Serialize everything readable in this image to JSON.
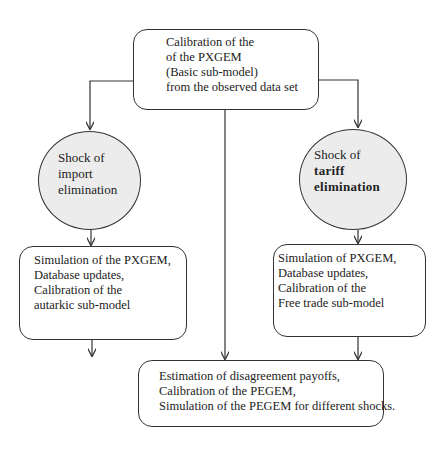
{
  "diagram": {
    "type": "flowchart",
    "top_box": {
      "lines": [
        "Calibration of the",
        "of the PXGEM",
        "(Basic sub-model)",
        "from the observed data set"
      ]
    },
    "left_ellipse": {
      "lines": [
        "Shock of",
        "import",
        "elimination"
      ]
    },
    "right_ellipse": {
      "lines": [
        "Shock of",
        "tariff",
        "elimination"
      ]
    },
    "left_box": {
      "lines": [
        "Simulation of the PXGEM,",
        "Database updates,",
        "Calibration of the",
        "autarkic sub-model"
      ]
    },
    "right_box": {
      "lines": [
        "Simulation of PXGEM,",
        "Database updates,",
        "Calibration of the",
        "Free trade sub-model"
      ]
    },
    "bottom_box": {
      "lines": [
        "Estimation of disagreement payoffs,",
        "Calibration of the PEGEM,",
        "Simulation of the PEGEM for different shocks."
      ]
    },
    "edges": [
      {
        "from": "top_box",
        "to": "left_ellipse"
      },
      {
        "from": "top_box",
        "to": "right_ellipse"
      },
      {
        "from": "top_box",
        "to": "bottom_box"
      },
      {
        "from": "left_ellipse",
        "to": "left_box"
      },
      {
        "from": "right_ellipse",
        "to": "right_box"
      },
      {
        "from": "left_box",
        "to": "bottom_box"
      },
      {
        "from": "right_box",
        "to": "bottom_box"
      }
    ],
    "colors": {
      "stroke": "#333333",
      "ellipse_fill": "#ececec",
      "box_fill": "#ffffff"
    }
  }
}
